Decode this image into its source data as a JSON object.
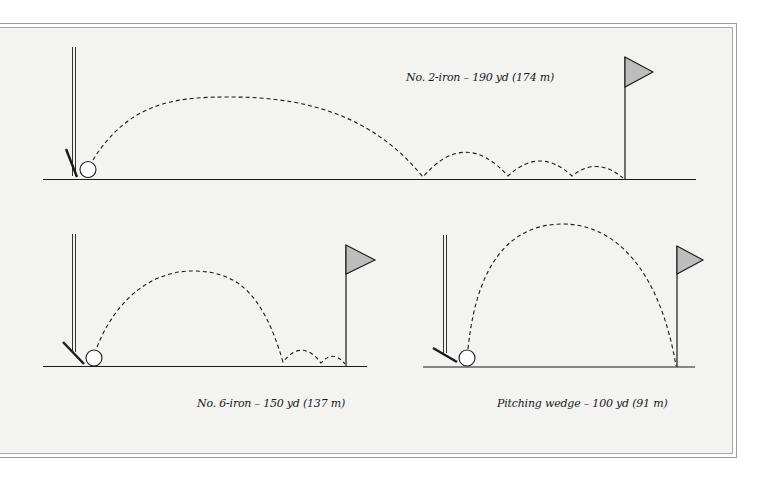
{
  "figure": {
    "background_outside": "#ffffff",
    "background_panel": "#f3f3f2",
    "line_color": "#1a1a1a",
    "flag_fill": "#bdbdbd"
  },
  "panels": [
    {
      "id": "two-iron",
      "label": "No. 2-iron – 190 yd (174 m)",
      "club": "No. 2-iron",
      "distance_yd": 190,
      "distance_m": 174,
      "bounces": 3
    },
    {
      "id": "six-iron",
      "label": "No. 6-iron – 150 yd (137 m)",
      "club": "No. 6-iron",
      "distance_yd": 150,
      "distance_m": 137,
      "bounces": 2
    },
    {
      "id": "pitching-wedge",
      "label": "Pitching wedge – 100 yd (91 m)",
      "club": "Pitching wedge",
      "distance_yd": 100,
      "distance_m": 91,
      "bounces": 0
    }
  ]
}
